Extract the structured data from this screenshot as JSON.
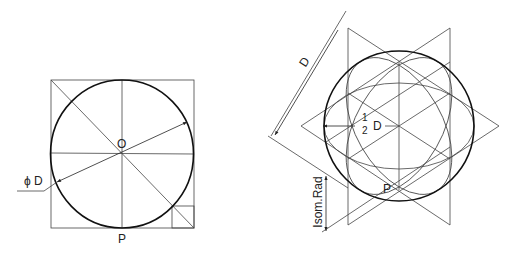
{
  "figures": [
    {
      "name": "circle-in-square",
      "labels": {
        "center": "O",
        "point": "P",
        "diameter": "ϕ D"
      }
    },
    {
      "name": "isometric-sphere",
      "labels": {
        "diameter": "D",
        "half_num": "1",
        "half_den": "2",
        "half_D": "D",
        "point": "P",
        "isom_rad": "Isom.Rad"
      }
    }
  ]
}
